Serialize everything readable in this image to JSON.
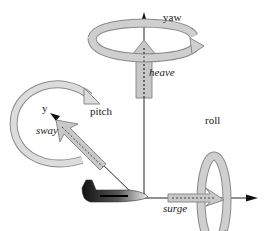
{
  "diagram": {
    "type": "six-degrees-of-freedom",
    "colors": {
      "arrow_fill": "#c8c8c8",
      "arrow_stroke": "#8a8a8a",
      "axis": "#222222",
      "aircraft_dark": "#1a1a1a",
      "aircraft_light": "#e8e8e8"
    },
    "labels": {
      "yaw": "yaw",
      "heave": "heave",
      "pitch": "pitch",
      "y_axis": "y",
      "sway": "sway",
      "roll": "roll",
      "surge": "surge"
    },
    "motions": [
      {
        "name": "yaw",
        "kind": "rotation",
        "axis": "vertical"
      },
      {
        "name": "heave",
        "kind": "translation",
        "axis": "vertical"
      },
      {
        "name": "pitch",
        "kind": "rotation",
        "axis": "y"
      },
      {
        "name": "sway",
        "kind": "translation",
        "axis": "y"
      },
      {
        "name": "roll",
        "kind": "rotation",
        "axis": "longitudinal"
      },
      {
        "name": "surge",
        "kind": "translation",
        "axis": "longitudinal"
      }
    ]
  }
}
